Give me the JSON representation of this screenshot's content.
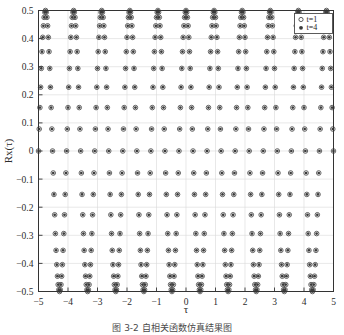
{
  "chart_data": {
    "type": "scatter",
    "title": "",
    "xlabel": "τ",
    "ylabel": "Rx(τ)",
    "xlim": [
      -5,
      5
    ],
    "ylim": [
      -0.5,
      0.5
    ],
    "xticks": [
      -5,
      -4,
      -3,
      -2,
      -1,
      0,
      1,
      2,
      3,
      4,
      5
    ],
    "xticklabels": [
      "−5",
      "−4",
      "−3",
      "−2",
      "−1",
      "0",
      "1",
      "2",
      "3",
      "4",
      "5"
    ],
    "yticks": [
      -0.5,
      -0.4,
      -0.3,
      -0.2,
      -0.1,
      0,
      0.1,
      0.2,
      0.3,
      0.4,
      0.5
    ],
    "yticklabels": [
      "−0.5",
      "−0.4",
      "−0.3",
      "−0.2",
      "−0.1",
      "0",
      "0.1",
      "0.2",
      "0.3",
      "0.4",
      "0.5"
    ],
    "grid": true,
    "legend_position": "upper right",
    "amplitude": 0.5,
    "carrier_frequency": 10.5,
    "sample_count": 420,
    "series": [
      {
        "name": "t=1",
        "marker": "open-circle",
        "color": "#4a4a4a",
        "amplitude": 0.5,
        "frequency": 10.5,
        "phase": 0
      },
      {
        "name": "t=4",
        "marker": "filled-dot",
        "color": "#3a3a3a",
        "amplitude": 0.5,
        "frequency": 10.5,
        "phase": 0
      }
    ]
  },
  "legend": {
    "entries": [
      {
        "label": "t=1",
        "marker": "open-circle"
      },
      {
        "label": "t=4",
        "marker": "filled-dot"
      }
    ]
  },
  "caption": {
    "text": "图 3-2    自相关函数仿真结果图"
  },
  "colors": {
    "axis": "#333333",
    "grid": "#d9d9d9",
    "marker": "#4a4a4a",
    "background": "#ffffff"
  }
}
